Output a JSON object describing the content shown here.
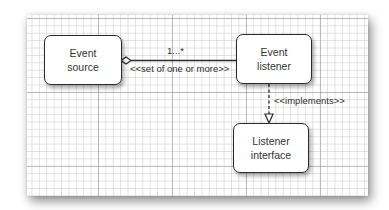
{
  "diagram": {
    "type": "uml-class-diagram",
    "nodes": [
      {
        "id": "event-source",
        "label": "Event\nsource"
      },
      {
        "id": "event-listener",
        "label": "Event\nlistener"
      },
      {
        "id": "listener-interface",
        "label": "Listener\ninterface"
      }
    ],
    "edges": [
      {
        "from": "event-source",
        "to": "event-listener",
        "kind": "aggregation",
        "multiplicity": "1...*",
        "stereotype": "<<set of one or more>>"
      },
      {
        "from": "event-listener",
        "to": "listener-interface",
        "kind": "realization",
        "stereotype": "<<implements>>"
      }
    ]
  },
  "colors": {
    "line": "#2b2b2b",
    "grid_major": "#9a9a9a",
    "grid_minor": "#cfcfcf",
    "box_fill": "#ffffff"
  }
}
